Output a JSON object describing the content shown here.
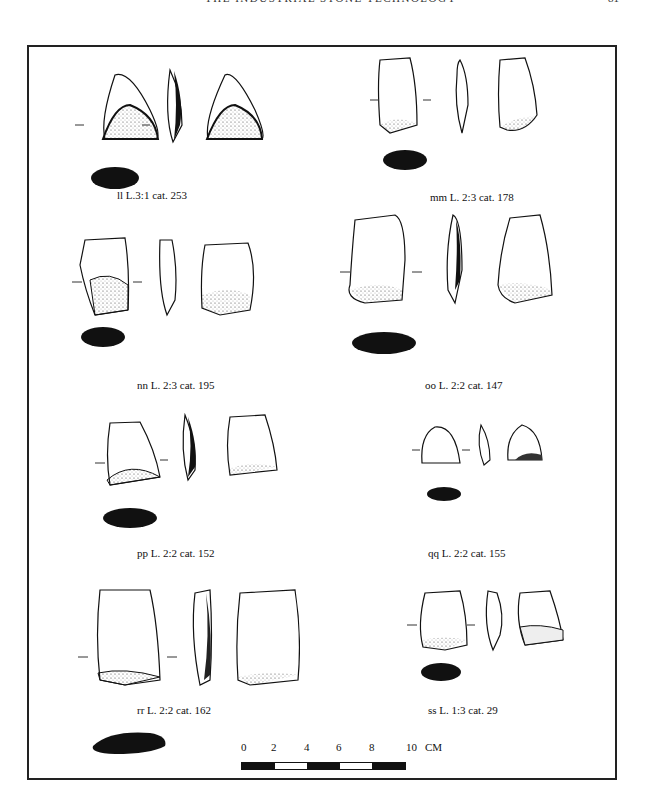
{
  "page": {
    "running_head": "THE INDUSTRIAL STONE TECHNOLOGY",
    "page_number": "81"
  },
  "figure": {
    "artifacts": [
      {
        "id": "ll",
        "label": "ll L.3:1 cat. 253"
      },
      {
        "id": "mm",
        "label": "mm L. 2:3 cat. 178"
      },
      {
        "id": "nn",
        "label": "nn L. 2:3 cat. 195"
      },
      {
        "id": "oo",
        "label": "oo L. 2:2 cat. 147"
      },
      {
        "id": "pp",
        "label": "pp L. 2:2 cat. 152"
      },
      {
        "id": "qq",
        "label": "qq L. 2:2 cat. 155"
      },
      {
        "id": "rr",
        "label": "rr L. 2:2 cat. 162"
      },
      {
        "id": "ss",
        "label": "ss L. 1:3 cat. 29"
      }
    ],
    "scale": {
      "ticks": [
        "0",
        "2",
        "4",
        "6",
        "8",
        "10"
      ],
      "unit": "CM",
      "colors": {
        "dark": "#111111",
        "light": "#ffffff"
      }
    }
  }
}
